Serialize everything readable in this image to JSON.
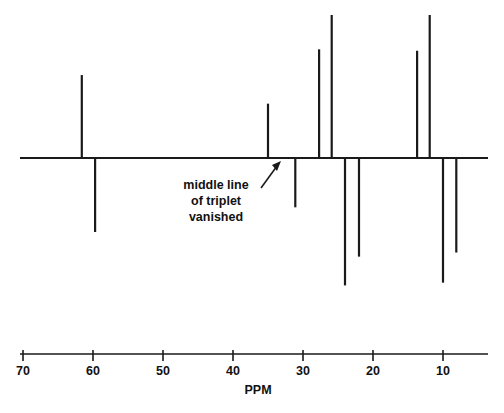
{
  "figure": {
    "kind": "nmr-spectrum",
    "background_color": "#ffffff",
    "line_color": "#1a1a1a"
  },
  "annotation": {
    "line1": "middle line",
    "line2": "of triplet",
    "line3": "vanished",
    "arrow_name": "annotation-arrow"
  },
  "axis": {
    "unit_label": "PPM",
    "tick_labels": [
      "70",
      "60",
      "50",
      "40",
      "30",
      "20",
      "10"
    ],
    "tick_values": [
      70,
      60,
      50,
      40,
      30,
      20,
      10
    ]
  },
  "chart_data": {
    "type": "bar",
    "title": "",
    "subtitle": "",
    "xlabel": "PPM",
    "ylabel": "",
    "xlim": [
      73.3,
      6.0
    ],
    "ylim": [
      -1.0,
      1.0
    ],
    "grid": false,
    "legend": null,
    "x_axis_inverted": true,
    "baseline_value": 0,
    "annotations": [
      {
        "text": "middle line of triplet vanished",
        "points_to_ppm": 31.1,
        "points_to_value": 0
      }
    ],
    "categories": [
      61.6,
      59.7,
      35.0,
      31.1,
      27.7,
      25.9,
      24.0,
      22.0,
      13.7,
      11.9,
      10.0,
      8.1
    ],
    "values": [
      0.58,
      -0.54,
      0.38,
      -0.36,
      0.76,
      1.0,
      -0.93,
      -0.72,
      0.75,
      1.0,
      -0.91,
      -0.69
    ],
    "series": [
      {
        "name": "DEPT-135 carbon signals",
        "points": [
          {
            "ppm": 61.6,
            "intensity": 0.58,
            "phase": "up"
          },
          {
            "ppm": 59.7,
            "intensity": -0.54,
            "phase": "down"
          },
          {
            "ppm": 35.0,
            "intensity": 0.38,
            "phase": "up"
          },
          {
            "ppm": 31.1,
            "intensity": -0.36,
            "phase": "down"
          },
          {
            "ppm": 27.7,
            "intensity": 0.76,
            "phase": "up"
          },
          {
            "ppm": 25.9,
            "intensity": 1.0,
            "phase": "up"
          },
          {
            "ppm": 24.0,
            "intensity": -0.93,
            "phase": "down"
          },
          {
            "ppm": 22.0,
            "intensity": -0.72,
            "phase": "down"
          },
          {
            "ppm": 13.7,
            "intensity": 0.75,
            "phase": "up"
          },
          {
            "ppm": 11.9,
            "intensity": 1.0,
            "phase": "up"
          },
          {
            "ppm": 10.0,
            "intensity": -0.91,
            "phase": "down"
          },
          {
            "ppm": 8.1,
            "intensity": -0.69,
            "phase": "down"
          }
        ]
      }
    ]
  }
}
